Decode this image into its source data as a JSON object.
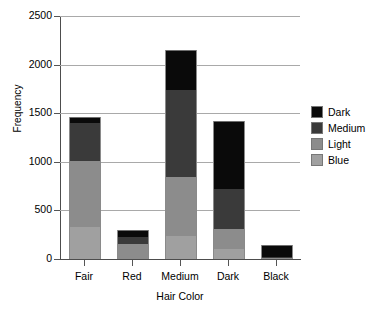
{
  "chart_data": {
    "type": "bar",
    "subtype": "stacked",
    "title": "",
    "xlabel": "Hair Color",
    "ylabel": "Frequency",
    "categories": [
      "Fair",
      "Red",
      "Medium",
      "Dark",
      "Black"
    ],
    "ytick_labels": [
      "0",
      "500",
      "1000",
      "1500",
      "2000",
      "2500"
    ],
    "ytick_values": [
      0,
      500,
      1000,
      1500,
      2000,
      2500
    ],
    "ylim": [
      0,
      2500
    ],
    "grid": true,
    "legend_position": "right",
    "series": [
      {
        "name": "Blue",
        "color": "#a0a0a0",
        "values": [
          326,
          0,
          235,
          105,
          0
        ]
      },
      {
        "name": "Light",
        "color": "#8c8c8c",
        "values": [
          684,
          150,
          605,
          205,
          10
        ]
      },
      {
        "name": "Medium",
        "color": "#3a3a3a",
        "values": [
          390,
          75,
          895,
          410,
          10
        ]
      },
      {
        "name": "Dark",
        "color": "#0a0a0a",
        "values": [
          55,
          65,
          405,
          685,
          110
        ]
      }
    ],
    "totals": [
      1455,
      290,
      2140,
      1405,
      130
    ],
    "legend_order_top_to_bottom": [
      "Dark",
      "Medium",
      "Light",
      "Blue"
    ]
  },
  "colors": {
    "dark": "#0a0a0a",
    "medium": "#3a3a3a",
    "light": "#8c8c8c",
    "blue": "#a0a0a0",
    "gridline": "#a9a9a9",
    "axis": "#4d4d4d",
    "background": "#ffffff"
  }
}
